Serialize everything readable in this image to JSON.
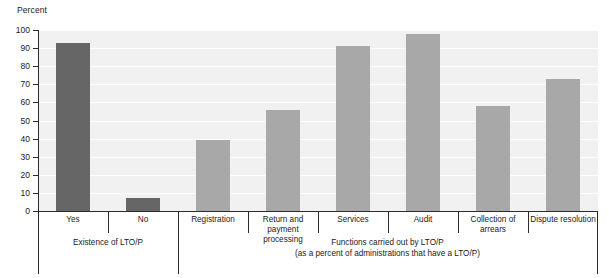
{
  "chart_data": {
    "type": "bar",
    "title": "",
    "ylabel": "Percent",
    "xlabel": "",
    "ylim": [
      0,
      100
    ],
    "ytick_step": 10,
    "yticks": [
      100,
      90,
      80,
      70,
      60,
      50,
      40,
      30,
      20,
      10,
      0
    ],
    "grid": true,
    "legend": "none",
    "categories": [
      "Yes",
      "No",
      "Registration",
      "Return and payment processing",
      "Services",
      "Audit",
      "Collection of arrears",
      "Dispute resolution"
    ],
    "values": [
      93,
      7,
      39,
      56,
      91,
      98,
      58,
      73
    ],
    "bar_colors": [
      "#666666",
      "#666666",
      "#a8a8a8",
      "#a8a8a8",
      "#a8a8a8",
      "#a8a8a8",
      "#a8a8a8",
      "#a8a8a8"
    ],
    "groups": [
      {
        "caption": "Existence of LTO/P",
        "subcaption": "",
        "category_indices": [
          0,
          1
        ]
      },
      {
        "caption": "Functions carried out by LTO/P",
        "subcaption": "(as a percent of administrations that have a LTO/P)",
        "category_indices": [
          2,
          3,
          4,
          5,
          6,
          7
        ]
      }
    ]
  },
  "category_labels": {
    "yes": "Yes",
    "no": "No",
    "registration": "Registration",
    "return_payment_line1": "Return and payment",
    "return_payment_line2": "processing",
    "services": "Services",
    "audit": "Audit",
    "collection_of_arrears": "Collection of arrears",
    "dispute_resolution": "Dispute resolution"
  },
  "captions": {
    "group1": "Existence of LTO/P",
    "group2_line1": "Functions carried out by LTO/P",
    "group2_line2": "(as a percent of administrations that have a LTO/P)"
  },
  "colors": {
    "bar_dark": "#666666",
    "bar_light": "#a8a8a8",
    "plot_background": "#f1f1f1",
    "gridline": "#fdfdfd",
    "axis": "#2b2b2b",
    "text": "#1a1a1a"
  }
}
